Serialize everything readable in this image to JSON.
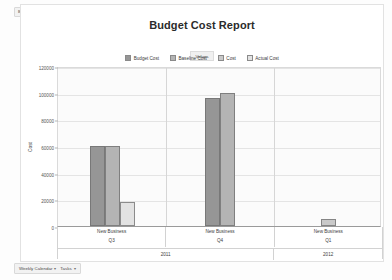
{
  "filter_bar": {
    "chips": [
      "Budget Cost",
      "Baseline Cost",
      "Cost",
      "Actual Cost"
    ]
  },
  "report": {
    "title": "Budget Cost Report",
    "legend_title": "Values",
    "legend": [
      {
        "label": "Budget Cost",
        "color": "#969696"
      },
      {
        "label": "Baseline Cost",
        "color": "#b4b4b4"
      },
      {
        "label": "Cost",
        "color": "#c9c9c9"
      },
      {
        "label": "Actual Cost",
        "color": "#e2e2e2"
      }
    ]
  },
  "status_bar": {
    "items": [
      {
        "label": "Weekly Calendar",
        "caret": "▾"
      },
      {
        "label": "Tasks",
        "caret": "▾"
      }
    ]
  },
  "chart_data": {
    "type": "bar",
    "title": "Budget Cost Report",
    "xlabel": "",
    "ylabel": "Cost",
    "ylim": [
      0,
      120000
    ],
    "yticks": [
      0,
      20000,
      40000,
      60000,
      80000,
      100000,
      120000
    ],
    "ytick_labels": [
      "0",
      "20000",
      "40000",
      "60000",
      "80000",
      "100000",
      "120000"
    ],
    "grid": true,
    "legend_position": "top-center",
    "categories": [
      {
        "name": "New Business",
        "quarter": "Q3",
        "year": "2011"
      },
      {
        "name": "New Business",
        "quarter": "Q4",
        "year": "2011"
      },
      {
        "name": "New Business",
        "quarter": "Q1",
        "year": "2012"
      }
    ],
    "series": [
      {
        "name": "Budget Cost",
        "color": "#969696",
        "values": [
          60000,
          96000,
          0
        ]
      },
      {
        "name": "Baseline Cost",
        "color": "#b4b4b4",
        "values": [
          60000,
          100000,
          0
        ]
      },
      {
        "name": "Cost",
        "color": "#c9c9c9",
        "values": [
          0,
          0,
          5000
        ]
      },
      {
        "name": "Actual Cost",
        "color": "#e2e2e2",
        "values": [
          18000,
          0,
          0
        ]
      }
    ]
  }
}
